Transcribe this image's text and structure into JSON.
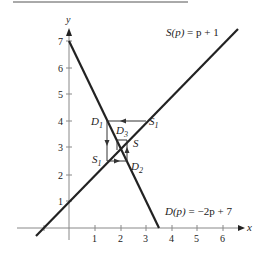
{
  "diagram": {
    "axes": {
      "x_label": "x",
      "y_label": "y",
      "x_ticks": [
        "1",
        "2",
        "3",
        "4",
        "5",
        "6"
      ],
      "y_ticks": [
        "1",
        "2",
        "3",
        "4",
        "5",
        "6",
        "7"
      ]
    },
    "curves": [
      {
        "name": "supply",
        "label_fn": "S(p)",
        "label_eq": " = p + 1",
        "slope": 1,
        "intercept": 1
      },
      {
        "name": "demand",
        "label_fn": "D(p)",
        "label_eq": " = −2p + 7",
        "slope": -2,
        "intercept": 7
      }
    ],
    "points": {
      "D1": {
        "main": "D",
        "sub": "1",
        "x": 1.5,
        "y": 4
      },
      "S1_right": {
        "main": "S",
        "sub": "1",
        "x": 3,
        "y": 4
      },
      "D3": {
        "main": "D",
        "sub": "3",
        "x": 2.25,
        "y": 3.25
      },
      "S": {
        "main": "S",
        "sub": "",
        "x": 2.25,
        "y": 3.25
      },
      "S1_left": {
        "main": "S",
        "sub": "1",
        "x": 1.5,
        "y": 2.5
      },
      "D2": {
        "main": "D",
        "sub": "2",
        "x": 2.25,
        "y": 2.5
      }
    }
  }
}
